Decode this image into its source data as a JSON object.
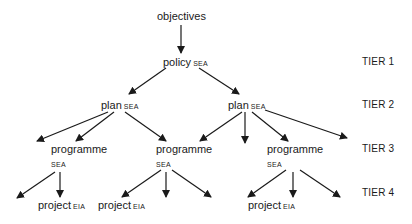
{
  "nodes": {
    "objectives": {
      "label": "objectives"
    },
    "policy": {
      "label": "policy",
      "tag": "SEA"
    },
    "plan_left": {
      "label": "plan",
      "tag": "SEA"
    },
    "plan_right": {
      "label": "plan",
      "tag": "SEA"
    },
    "programme_left": {
      "label": "programme",
      "tag": "SEA"
    },
    "programme_mid": {
      "label": "programme",
      "tag": "SEA"
    },
    "programme_right": {
      "label": "programme",
      "tag": "SEA"
    },
    "project_left": {
      "label": "project",
      "tag": "EIA"
    },
    "project_mid": {
      "label": "project",
      "tag": "EIA"
    },
    "project_right": {
      "label": "project",
      "tag": "EIA"
    }
  },
  "tiers": [
    {
      "label": "TIER 1"
    },
    {
      "label": "TIER 2"
    },
    {
      "label": "TIER 3"
    },
    {
      "label": "TIER 4"
    }
  ],
  "colors": {
    "line": "#1a1a1a",
    "text": "#1a1a1a",
    "background": "#ffffff"
  }
}
